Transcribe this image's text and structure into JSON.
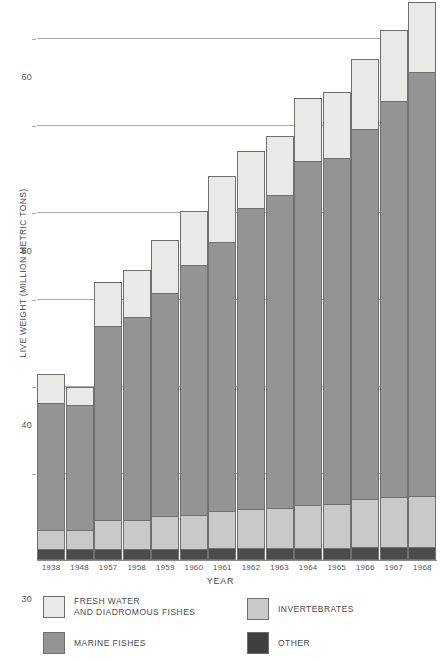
{
  "chart_data": {
    "type": "bar",
    "stacked": true,
    "title": "",
    "xlabel": "YEAR",
    "ylabel": "LIVE WEIGHT (MILLION METRIC TONS)",
    "categories": [
      "1938",
      "1948",
      "1957",
      "1958",
      "1959",
      "1960",
      "1961",
      "1962",
      "1963",
      "1964",
      "1965",
      "1966",
      "1967",
      "1968"
    ],
    "ylim": [
      0,
      64.4
    ],
    "yticks": [
      0,
      10,
      20,
      30,
      40,
      50,
      60
    ],
    "ytick_labels": [
      "0",
      "10",
      "20",
      "30",
      "40",
      "50",
      "60"
    ],
    "grid": "horizontal",
    "legend_position": "below-plot",
    "stack_order_bottom_to_top": [
      "OTHER",
      "INVERTEBRATES",
      "MARINE FISHES",
      "FRESH WATER AND DIADROMOUS FISHES"
    ],
    "series": [
      {
        "name": "OTHER",
        "color": "#4b4b4b",
        "values": [
          1.2,
          1.1,
          1.2,
          1.2,
          1.2,
          1.2,
          1.3,
          1.3,
          1.3,
          1.3,
          1.3,
          1.4,
          1.4,
          1.4
        ]
      },
      {
        "name": "INVERTEBRATES",
        "color": "#c9c9c7",
        "values": [
          2.1,
          2.2,
          3.3,
          3.3,
          3.7,
          3.9,
          4.2,
          4.4,
          4.6,
          4.9,
          5.0,
          5.5,
          5.7,
          5.9
        ]
      },
      {
        "name": "MARINE FISHES",
        "color": "#949494",
        "values": [
          14.6,
          14.4,
          22.3,
          23.3,
          25.7,
          28.7,
          30.9,
          34.6,
          35.9,
          39.6,
          39.8,
          42.5,
          45.6,
          48.7
        ]
      },
      {
        "name": "FRESH WATER AND DIADROMOUS FISHES",
        "color": "#e9e9e7",
        "values": [
          3.4,
          2.1,
          5.0,
          5.4,
          6.1,
          6.2,
          7.6,
          6.6,
          6.8,
          7.2,
          7.6,
          8.1,
          8.1,
          8.0
        ]
      }
    ],
    "totals": [
      21.3,
      19.8,
      31.8,
      33.2,
      36.7,
      40.0,
      44.0,
      46.9,
      48.6,
      53.0,
      53.7,
      57.5,
      60.8,
      64.0
    ]
  },
  "legend": {
    "items": [
      {
        "key": "fresh",
        "label": "FRESH WATER\nAND DIADROMOUS FISHES",
        "color": "#e9e9e7"
      },
      {
        "key": "invert",
        "label": "INVERTEBRATES",
        "color": "#c9c9c7"
      },
      {
        "key": "marine",
        "label": "MARINE FISHES",
        "color": "#949494"
      },
      {
        "key": "other",
        "label": "OTHER",
        "color": "#3f3f3f"
      }
    ]
  }
}
